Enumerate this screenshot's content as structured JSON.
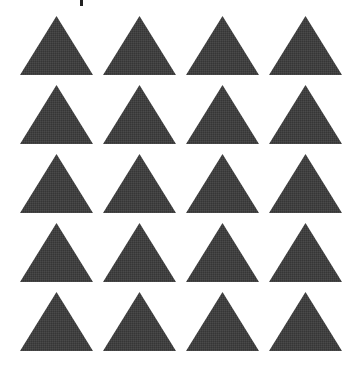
{
  "figure": {
    "rows": 5,
    "columns": 4,
    "shape": "triangle-up",
    "fill_color": "#404040",
    "background_color": "#ffffff",
    "count": 20
  },
  "top_text": {
    "label": "(cropped text, not legible)"
  },
  "cells": [
    {
      "row": 1,
      "col": 1,
      "shape": "triangle-up"
    },
    {
      "row": 1,
      "col": 2,
      "shape": "triangle-up"
    },
    {
      "row": 1,
      "col": 3,
      "shape": "triangle-up"
    },
    {
      "row": 1,
      "col": 4,
      "shape": "triangle-up"
    },
    {
      "row": 2,
      "col": 1,
      "shape": "triangle-up"
    },
    {
      "row": 2,
      "col": 2,
      "shape": "triangle-up"
    },
    {
      "row": 2,
      "col": 3,
      "shape": "triangle-up"
    },
    {
      "row": 2,
      "col": 4,
      "shape": "triangle-up"
    },
    {
      "row": 3,
      "col": 1,
      "shape": "triangle-up"
    },
    {
      "row": 3,
      "col": 2,
      "shape": "triangle-up"
    },
    {
      "row": 3,
      "col": 3,
      "shape": "triangle-up"
    },
    {
      "row": 3,
      "col": 4,
      "shape": "triangle-up"
    },
    {
      "row": 4,
      "col": 1,
      "shape": "triangle-up"
    },
    {
      "row": 4,
      "col": 2,
      "shape": "triangle-up"
    },
    {
      "row": 4,
      "col": 3,
      "shape": "triangle-up"
    },
    {
      "row": 4,
      "col": 4,
      "shape": "triangle-up"
    },
    {
      "row": 5,
      "col": 1,
      "shape": "triangle-up"
    },
    {
      "row": 5,
      "col": 2,
      "shape": "triangle-up"
    },
    {
      "row": 5,
      "col": 3,
      "shape": "triangle-up"
    },
    {
      "row": 5,
      "col": 4,
      "shape": "triangle-up"
    }
  ]
}
